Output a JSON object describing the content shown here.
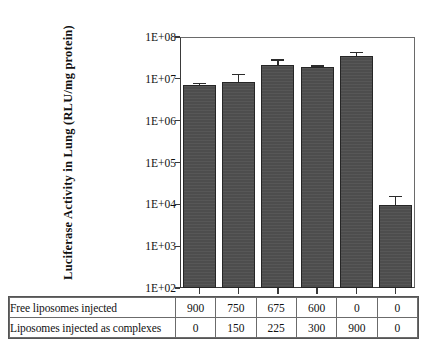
{
  "chart_data": {
    "type": "bar",
    "title": "",
    "xlabel": "",
    "ylabel": "Luciferase Activity in Lung (RLU/mg protein)",
    "yscale": "log",
    "ylim": [
      100,
      100000000
    ],
    "ytick_labels": [
      "1E+08",
      "1E+07",
      "1E+06",
      "1E+05",
      "1E+04",
      "1E+03",
      "1E+02"
    ],
    "ytick_values": [
      100000000,
      10000000,
      1000000,
      100000,
      10000,
      1000,
      100
    ],
    "grid": false,
    "legend": "none",
    "bar_color": "#4d4d4d",
    "categories": [
      "1",
      "2",
      "3",
      "4",
      "5",
      "6"
    ],
    "values": [
      7000000,
      8500000,
      22000000.0,
      19000000.0,
      36000000.0,
      9800
    ],
    "errors_upper": [
      8000000,
      13000000.0,
      29000000.0,
      21000000.0,
      44000000.0,
      16000
    ],
    "errors_lower": [
      6200000,
      5800000,
      17000000.0,
      17000000.0,
      30000000.0,
      6000
    ],
    "series": [
      {
        "name": "Luciferase activity",
        "values": [
          7000000,
          8500000,
          22000000,
          19000000,
          36000000,
          9800
        ]
      }
    ]
  },
  "table": {
    "rows": [
      {
        "label": "Free liposomes injected",
        "values": [
          "900",
          "750",
          "675",
          "600",
          "0",
          "0"
        ]
      },
      {
        "label": "Liposomes injected as complexes",
        "values": [
          "0",
          "150",
          "225",
          "300",
          "900",
          "0"
        ]
      }
    ]
  },
  "axis": {
    "y_title": "Luciferase Activity in Lung (RLU/mg protein)",
    "ticks": [
      "1E+08",
      "1E+07",
      "1E+06",
      "1E+05",
      "1E+04",
      "1E+03",
      "1E+02"
    ]
  }
}
